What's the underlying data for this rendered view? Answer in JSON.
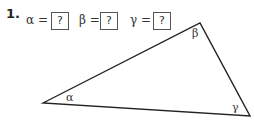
{
  "problem": {
    "number": "1.",
    "equations": [
      {
        "symbol": "α",
        "equals": "=",
        "answer": "?"
      },
      {
        "symbol": "β",
        "equals": "=",
        "answer": "?"
      },
      {
        "symbol": "γ",
        "equals": "=",
        "answer": "?"
      }
    ]
  },
  "triangle": {
    "vertices": {
      "alpha": {
        "x": 43,
        "y": 103,
        "label": "α"
      },
      "beta": {
        "x": 200,
        "y": 23,
        "label": "β"
      },
      "gamma": {
        "x": 250,
        "y": 116,
        "label": "γ"
      }
    },
    "stroke_color": "#222222"
  }
}
